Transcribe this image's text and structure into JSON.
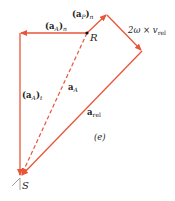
{
  "diagram": {
    "colors": {
      "vector": "#e8553a",
      "text": "#222222",
      "point": "#111111",
      "ground": "#888888"
    },
    "points": {
      "R": {
        "label": "R",
        "x": 87,
        "y": 33
      },
      "S": {
        "label": "S",
        "x": 20,
        "y": 177
      }
    },
    "labels": {
      "aA_n": {
        "main": "(a",
        "sub": "A",
        "close": ")",
        "sub2": "n"
      },
      "aP_n": {
        "main": "(a",
        "sub": "P",
        "close": ")",
        "sub2": "n"
      },
      "coriolis": {
        "text": "2ω × v",
        "sub": "rel"
      },
      "aA_t": {
        "main": "(a",
        "sub": "A",
        "close": ")",
        "sub2": "t"
      },
      "aA": {
        "main": "a",
        "sub": "A"
      },
      "a_rel": {
        "main": "a",
        "sub": "rel"
      },
      "caption": "(e)"
    }
  }
}
